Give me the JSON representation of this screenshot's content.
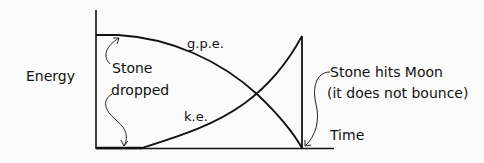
{
  "diagram": {
    "y_axis_label": "Energy",
    "x_axis_label": "Time",
    "curves": [
      {
        "name": "g.p.e.",
        "description": "gravitational potential energy, starts at maximum and decreases with increasing slope to zero at impact"
      },
      {
        "name": "k.e.",
        "description": "kinetic energy, starts at zero and increases to maximum at impact, then drops vertically to zero"
      }
    ],
    "annotations": {
      "stone_dropped_line1": "Stone",
      "stone_dropped_line2": "dropped",
      "impact_line1": "Stone hits Moon",
      "impact_line2": "(it does not bounce)"
    },
    "colors": {
      "ink": "#111111",
      "background": "#fbfbfb"
    }
  }
}
